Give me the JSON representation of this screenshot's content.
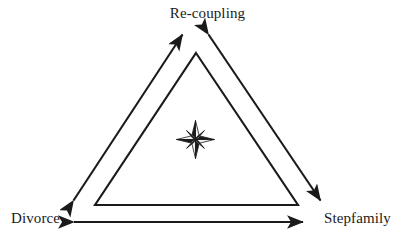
{
  "diagram": {
    "background_color": "#ffffff",
    "stroke_color": "#1a1a1a",
    "nodes": [
      {
        "id": "top",
        "label": "Re-coupling"
      },
      {
        "id": "left",
        "label": "Divorce"
      },
      {
        "id": "right",
        "label": "Stepfamily"
      }
    ],
    "center_icon": {
      "name": "compass-rose-star",
      "points": 8,
      "dark_color": "#1a1a1a",
      "light_color": "#f2f2f2"
    },
    "connectors": [
      {
        "id": "left-edge",
        "from": "left",
        "to": "top",
        "style": "double-headed-arrow"
      },
      {
        "id": "right-edge",
        "from": "top",
        "to": "right",
        "style": "double-headed-arrow"
      },
      {
        "id": "bottom-edge",
        "from": "left",
        "to": "right",
        "style": "double-headed-arrow"
      }
    ],
    "inner_shape": {
      "name": "inner-triangle",
      "apex": {
        "x": 196,
        "y": 53
      },
      "bottom_left": {
        "x": 95,
        "y": 205
      },
      "bottom_right": {
        "x": 298,
        "y": 205
      }
    }
  }
}
